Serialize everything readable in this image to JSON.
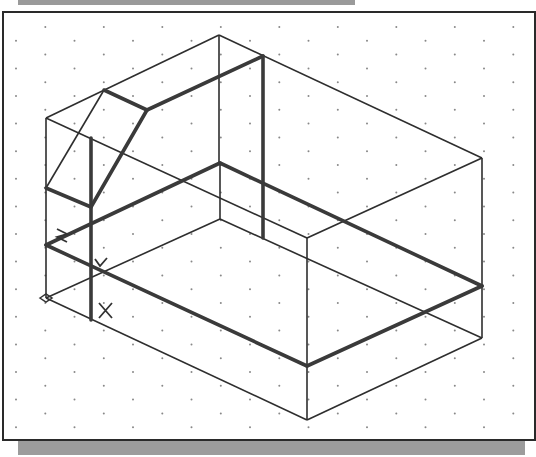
{
  "viewport": {
    "type": "isometric-drawing",
    "grid": {
      "style": "isometric-dots",
      "dx": 58.5,
      "dy": 13.8,
      "x0": 16,
      "y0": 27
    },
    "colors": {
      "thin": "#2e2e2e",
      "thick": "#3a3a3a",
      "grid_dot": "#888888",
      "frame": "#2a2a2a",
      "shadow": "#9c9c9c"
    }
  },
  "ucs_icon": {
    "origin": [
      46,
      298
    ],
    "labels": {
      "x": "X",
      "y": "Y",
      "z": "Z"
    }
  },
  "model": {
    "thin_lines": [
      [
        [
          46,
          118
        ],
        [
          219,
          35
        ]
      ],
      [
        [
          219,
          35
        ],
        [
          482,
          158
        ]
      ],
      [
        [
          46,
          118
        ],
        [
          46,
          298
        ]
      ],
      [
        [
          219,
          35
        ],
        [
          219,
          163
        ]
      ],
      [
        [
          482,
          158
        ],
        [
          307,
          238
        ]
      ],
      [
        [
          307,
          238
        ],
        [
          307,
          420
        ]
      ],
      [
        [
          482,
          158
        ],
        [
          482,
          338
        ]
      ],
      [
        [
          46,
          118
        ],
        [
          307,
          238
        ]
      ],
      [
        [
          104,
          90
        ],
        [
          46,
          188
        ]
      ],
      [
        [
          220,
          163
        ],
        [
          220,
          219
        ]
      ],
      [
        [
          220,
          219
        ],
        [
          46,
          298
        ]
      ],
      [
        [
          220,
          219
        ],
        [
          482,
          338
        ]
      ],
      [
        [
          46,
          298
        ],
        [
          307,
          420
        ]
      ],
      [
        [
          307,
          420
        ],
        [
          482,
          338
        ]
      ]
    ],
    "thick_lines": [
      [
        [
          104,
          90
        ],
        [
          147,
          110
        ]
      ],
      [
        [
          147,
          110
        ],
        [
          263,
          56
        ]
      ],
      [
        [
          147,
          110
        ],
        [
          91,
          207
        ]
      ],
      [
        [
          46,
          188
        ],
        [
          91,
          207
        ]
      ],
      [
        [
          91,
          138
        ],
        [
          91,
          320
        ]
      ],
      [
        [
          263,
          56
        ],
        [
          263,
          238
        ]
      ],
      [
        [
          46,
          245
        ],
        [
          220,
          163
        ]
      ],
      [
        [
          220,
          163
        ],
        [
          482,
          286
        ]
      ],
      [
        [
          46,
          245
        ],
        [
          307,
          366
        ]
      ],
      [
        [
          307,
          366
        ],
        [
          482,
          286
        ]
      ]
    ]
  }
}
